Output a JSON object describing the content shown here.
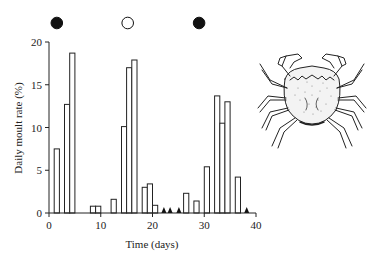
{
  "chart_data": {
    "type": "bar",
    "title": "",
    "xlabel": "Time (days)",
    "ylabel": "Daily moult rate (%)",
    "xlim": [
      0,
      40
    ],
    "ylim": [
      0,
      20
    ],
    "xticks": [
      0,
      10,
      20,
      30,
      40
    ],
    "yticks": [
      0,
      5,
      10,
      15,
      20
    ],
    "grid": false,
    "legend": null,
    "bar_style": "open (white fill, black outline)",
    "x": [
      1,
      3,
      4,
      8,
      9,
      12,
      14,
      15,
      16,
      18,
      19,
      20,
      26,
      28,
      30,
      32,
      33,
      34,
      36
    ],
    "values": [
      7.5,
      12.7,
      18.7,
      0.8,
      0.8,
      1.6,
      10.1,
      17.0,
      17.9,
      3.0,
      3.4,
      0.9,
      2.3,
      1.4,
      5.4,
      13.7,
      10.5,
      13.0,
      4.2
    ],
    "zero_markers": {
      "symbol": "filled triangle",
      "x": [
        22.2,
        23.4,
        25.1,
        38.2
      ]
    },
    "moon_phases": [
      {
        "day": 1.5,
        "phase": "new moon",
        "symbol": "filled circle"
      },
      {
        "day": 15.2,
        "phase": "full moon",
        "symbol": "open circle"
      },
      {
        "day": 29,
        "phase": "new moon",
        "symbol": "filled circle"
      }
    ],
    "annotations": [
      "crab illustration (top right)"
    ]
  },
  "labels": {
    "xlabel": "Time (days)",
    "ylabel": "Daily moult rate (%)",
    "xticks": [
      "0",
      "10",
      "20",
      "30",
      "40"
    ],
    "yticks": [
      "0",
      "5",
      "10",
      "15",
      "20"
    ]
  },
  "illustration": {
    "subject": "crab-icon"
  }
}
